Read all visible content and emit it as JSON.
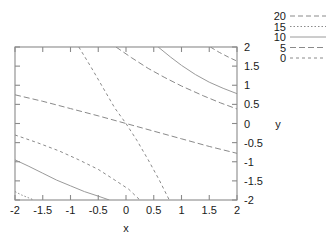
{
  "chart_data": {
    "type": "line",
    "title": "",
    "subtitle": "",
    "xlabel": "x",
    "ylabel": "y",
    "xlim": [
      -2,
      2
    ],
    "ylim": [
      -2,
      2
    ],
    "xticks": [
      "-2",
      "-1.5",
      "-1",
      "-0.5",
      "0",
      "0.5",
      "1",
      "1.5",
      "2"
    ],
    "xtick_values": [
      -2,
      -1.5,
      -1,
      -0.5,
      0,
      0.5,
      1,
      1.5,
      2
    ],
    "yticks": [
      "2",
      "1.5",
      "1",
      "0.5",
      "0",
      "-0.5",
      "-1",
      "-1.5",
      "-2"
    ],
    "ytick_values": [
      2,
      1.5,
      1,
      0.5,
      0,
      -0.5,
      -1,
      -1.5,
      -2
    ],
    "grid": false,
    "legend_position": "top-right-outside",
    "y_axis_side": "right",
    "legend": [
      {
        "label": "20",
        "style": "dashed",
        "dash": "5,3",
        "color": "#8a8a8a"
      },
      {
        "label": "15",
        "style": "dotted",
        "dash": "1.5,2",
        "color": "#8a8a8a"
      },
      {
        "label": "10",
        "style": "solid",
        "dash": "none",
        "color": "#9a9a9a"
      },
      {
        "label": "5",
        "style": "dashed",
        "dash": "6,3",
        "color": "#8a8a8a"
      },
      {
        "label": "0",
        "style": "dashed",
        "dash": "3,3",
        "color": "#8a8a8a"
      }
    ],
    "series": [
      {
        "name": "20",
        "level": 20,
        "style": "dashed",
        "points": [
          [
            1.52,
            2.0
          ],
          [
            1.68,
            1.86
          ],
          [
            1.84,
            1.74
          ],
          [
            2.0,
            1.63
          ]
        ]
      },
      {
        "name": "15",
        "level": 15,
        "style": "dotted",
        "points": [
          [
            -2.0,
            -1.78
          ],
          [
            -1.88,
            -1.87
          ],
          [
            -1.76,
            -1.94
          ],
          [
            -1.66,
            -2.0
          ]
        ]
      },
      {
        "name": "10",
        "level": 10,
        "style": "solid",
        "points": [
          [
            0.58,
            2.0
          ],
          [
            0.8,
            1.74
          ],
          [
            1.0,
            1.52
          ],
          [
            1.25,
            1.28
          ],
          [
            1.5,
            1.08
          ],
          [
            1.75,
            0.92
          ],
          [
            2.0,
            0.78
          ]
        ]
      },
      {
        "name": "10-lower",
        "level": 10,
        "style": "solid",
        "points": [
          [
            -2.0,
            -0.95
          ],
          [
            -1.75,
            -1.12
          ],
          [
            -1.5,
            -1.3
          ],
          [
            -1.25,
            -1.48
          ],
          [
            -1.0,
            -1.63
          ],
          [
            -0.75,
            -1.78
          ],
          [
            -0.5,
            -1.9
          ],
          [
            -0.3,
            -2.0
          ]
        ]
      },
      {
        "name": "5",
        "level": 5,
        "style": "dashed",
        "points": [
          [
            -2.0,
            0.75
          ],
          [
            -1.5,
            0.58
          ],
          [
            -1.0,
            0.39
          ],
          [
            -0.5,
            0.2
          ],
          [
            0.0,
            0.0
          ],
          [
            0.5,
            -0.2
          ],
          [
            1.0,
            -0.4
          ],
          [
            1.5,
            -0.6
          ],
          [
            2.0,
            -0.78
          ]
        ]
      },
      {
        "name": "5-upper",
        "level": 5,
        "style": "dashed",
        "points": [
          [
            -0.18,
            2.0
          ],
          [
            0.1,
            1.72
          ],
          [
            0.4,
            1.44
          ],
          [
            0.7,
            1.2
          ],
          [
            1.0,
            0.98
          ],
          [
            1.4,
            0.72
          ],
          [
            1.7,
            0.54
          ],
          [
            2.0,
            0.38
          ]
        ]
      },
      {
        "name": "0",
        "level": 0,
        "style": "dashed",
        "points": [
          [
            -2.0,
            -0.3
          ],
          [
            -1.6,
            -0.5
          ],
          [
            -1.2,
            -0.72
          ],
          [
            -0.85,
            -0.95
          ],
          [
            -0.5,
            -1.2
          ],
          [
            -0.2,
            -1.48
          ],
          [
            0.05,
            -1.72
          ],
          [
            0.25,
            -2.0
          ]
        ]
      },
      {
        "name": "0-steep",
        "level": 0,
        "style": "dashed",
        "points": [
          [
            -0.85,
            2.0
          ],
          [
            -0.62,
            1.45
          ],
          [
            -0.42,
            0.95
          ],
          [
            -0.2,
            0.4
          ],
          [
            0.0,
            0.0
          ],
          [
            0.2,
            -0.45
          ],
          [
            0.4,
            -0.95
          ],
          [
            0.6,
            -1.48
          ],
          [
            0.78,
            -2.0
          ]
        ]
      }
    ]
  },
  "plot_area": {
    "left": 15,
    "top": 47,
    "right": 237,
    "bottom": 200
  }
}
